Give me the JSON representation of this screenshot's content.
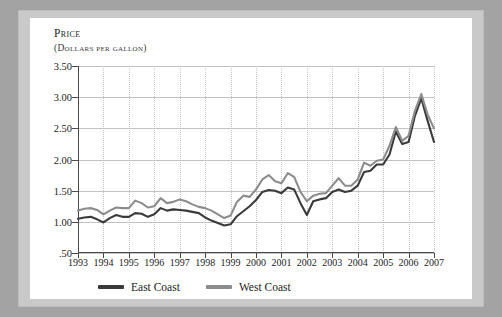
{
  "axis": {
    "y_title_line1": "Price",
    "y_title_line2": "(Dollars per gallon)",
    "y_ticks": [
      "3.50",
      "3.00",
      "2.50",
      "2.00",
      "1.50",
      "1.00",
      ".50"
    ],
    "x_ticks": [
      "1993",
      "1994",
      "1995",
      "1996",
      "1997",
      "1998",
      "1999",
      "2000",
      "2001",
      "2002",
      "2003",
      "2004",
      "2005",
      "2006",
      "2007"
    ]
  },
  "legend": {
    "items": [
      {
        "label": "East Coast",
        "color": "#3a3a3a"
      },
      {
        "label": "West Coast",
        "color": "#8c8c8c"
      }
    ]
  },
  "colors": {
    "east": "#3a3a3a",
    "west": "#8c8c8c",
    "axis": "#4a4a4a",
    "gridline": "#c2c2c2",
    "page": "#ffffff",
    "frame": "#c9c9c9",
    "mat": "#a3a3a3"
  },
  "chart_data": {
    "type": "line",
    "title": "Price (Dollars per gallon)",
    "xlabel": "",
    "ylabel": "Price (dollars per gallon)",
    "xlim": [
      1993,
      2007
    ],
    "ylim": [
      0.5,
      3.5
    ],
    "yticks": [
      0.5,
      1.0,
      1.5,
      2.0,
      2.5,
      3.0,
      3.5
    ],
    "xticks": [
      1993,
      1994,
      1995,
      1996,
      1997,
      1998,
      1999,
      2000,
      2001,
      2002,
      2003,
      2004,
      2005,
      2006,
      2007
    ],
    "grid": true,
    "legend_position": "bottom",
    "x": [
      1993.0,
      1993.25,
      1993.5,
      1993.75,
      1994.0,
      1994.25,
      1994.5,
      1994.75,
      1995.0,
      1995.25,
      1995.5,
      1995.75,
      1996.0,
      1996.25,
      1996.5,
      1996.75,
      1997.0,
      1997.25,
      1997.5,
      1997.75,
      1998.0,
      1998.25,
      1998.5,
      1998.75,
      1999.0,
      1999.25,
      1999.5,
      1999.75,
      2000.0,
      2000.25,
      2000.5,
      2000.75,
      2001.0,
      2001.25,
      2001.5,
      2001.75,
      2002.0,
      2002.25,
      2002.5,
      2002.75,
      2003.0,
      2003.25,
      2003.5,
      2003.75,
      2004.0,
      2004.25,
      2004.5,
      2004.75,
      2005.0,
      2005.25,
      2005.5,
      2005.75,
      2006.0,
      2006.25,
      2006.5,
      2006.75,
      2007.0
    ],
    "series": [
      {
        "name": "East Coast",
        "color": "#3a3a3a",
        "values": [
          1.05,
          1.07,
          1.08,
          1.04,
          0.99,
          1.06,
          1.11,
          1.08,
          1.08,
          1.14,
          1.13,
          1.08,
          1.12,
          1.22,
          1.18,
          1.2,
          1.19,
          1.18,
          1.16,
          1.14,
          1.07,
          1.02,
          0.98,
          0.94,
          0.96,
          1.09,
          1.17,
          1.25,
          1.35,
          1.48,
          1.51,
          1.5,
          1.46,
          1.55,
          1.52,
          1.3,
          1.11,
          1.33,
          1.36,
          1.38,
          1.48,
          1.52,
          1.48,
          1.5,
          1.58,
          1.8,
          1.82,
          1.92,
          1.92,
          2.08,
          2.45,
          2.25,
          2.28,
          2.7,
          2.98,
          2.62,
          2.28
        ]
      },
      {
        "name": "West Coast",
        "color": "#8c8c8c",
        "values": [
          1.18,
          1.21,
          1.22,
          1.19,
          1.12,
          1.18,
          1.23,
          1.22,
          1.22,
          1.34,
          1.3,
          1.23,
          1.25,
          1.38,
          1.3,
          1.32,
          1.36,
          1.33,
          1.28,
          1.24,
          1.22,
          1.18,
          1.12,
          1.06,
          1.1,
          1.32,
          1.42,
          1.4,
          1.52,
          1.68,
          1.75,
          1.65,
          1.62,
          1.78,
          1.72,
          1.48,
          1.33,
          1.42,
          1.45,
          1.46,
          1.58,
          1.7,
          1.58,
          1.58,
          1.68,
          1.95,
          1.9,
          1.98,
          2.0,
          2.22,
          2.52,
          2.3,
          2.38,
          2.78,
          3.05,
          2.72,
          2.5
        ]
      }
    ]
  }
}
